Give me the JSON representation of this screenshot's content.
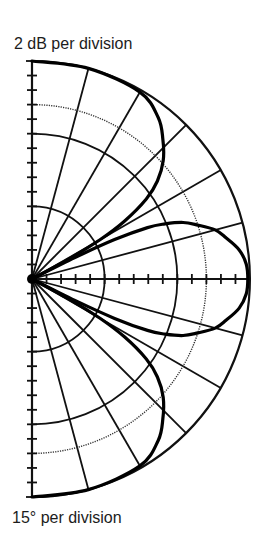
{
  "labels": {
    "radial_scale": "2 dB per division",
    "angular_scale": "15° per division"
  },
  "colors": {
    "background": "#ffffff",
    "grid": "#111111",
    "pattern": "#000000",
    "dotted_ring": "#333333"
  },
  "chart_data": {
    "type": "polar",
    "subtype": "half-polar radiation pattern (semicircle, right half)",
    "title": "",
    "radial_axis": {
      "label": "2 dB per division",
      "db_per_division": 2,
      "divisions": 15,
      "range_db": [
        -30,
        0
      ],
      "solid_rings_at_divisions": [
        5,
        10,
        15
      ],
      "dotted_ring_at_division": 12,
      "tick_marks": "every division along both the vertical and horizontal axes"
    },
    "angular_axis": {
      "label": "15° per division",
      "deg_per_division": 15,
      "range_deg": [
        -90,
        90
      ],
      "spokes_deg": [
        -75,
        -60,
        -45,
        -30,
        -15,
        15,
        30,
        45,
        60,
        75
      ]
    },
    "series": [
      {
        "name": "main lobes (upper / lower)",
        "comment": "normalized radius r/R (1 = 0 dB outer ring), angle from horizontal axis, symmetric about 0°",
        "points": [
          {
            "deg": 90,
            "r": 1.0
          },
          {
            "deg": 75,
            "r": 1.0
          },
          {
            "deg": 60,
            "r": 0.99
          },
          {
            "deg": 52,
            "r": 0.94
          },
          {
            "deg": 47,
            "r": 0.88
          },
          {
            "deg": 42,
            "r": 0.81
          },
          {
            "deg": 38,
            "r": 0.73
          },
          {
            "deg": 35,
            "r": 0.64
          },
          {
            "deg": 32,
            "r": 0.5
          },
          {
            "deg": 30,
            "r": 0.36
          },
          {
            "deg": 28.5,
            "r": 0.2
          },
          {
            "deg": 27.5,
            "r": 0.0
          }
        ]
      },
      {
        "name": "center lobe (on-axis)",
        "comment": "normalized radius r/R, symmetric about 0°",
        "points": [
          {
            "deg": 0,
            "r": 0.99
          },
          {
            "deg": 4,
            "r": 0.985
          },
          {
            "deg": 8,
            "r": 0.96
          },
          {
            "deg": 12,
            "r": 0.91
          },
          {
            "deg": 15,
            "r": 0.87
          },
          {
            "deg": 18,
            "r": 0.8
          },
          {
            "deg": 20.5,
            "r": 0.74
          },
          {
            "deg": 22.5,
            "r": 0.66
          },
          {
            "deg": 24,
            "r": 0.58
          },
          {
            "deg": 25.5,
            "r": 0.42
          },
          {
            "deg": 26.5,
            "r": 0.22
          },
          {
            "deg": 27,
            "r": 0.0
          }
        ]
      }
    ],
    "geometry_px": {
      "center_x": 32,
      "center_y": 279,
      "outer_radius": 218
    }
  }
}
